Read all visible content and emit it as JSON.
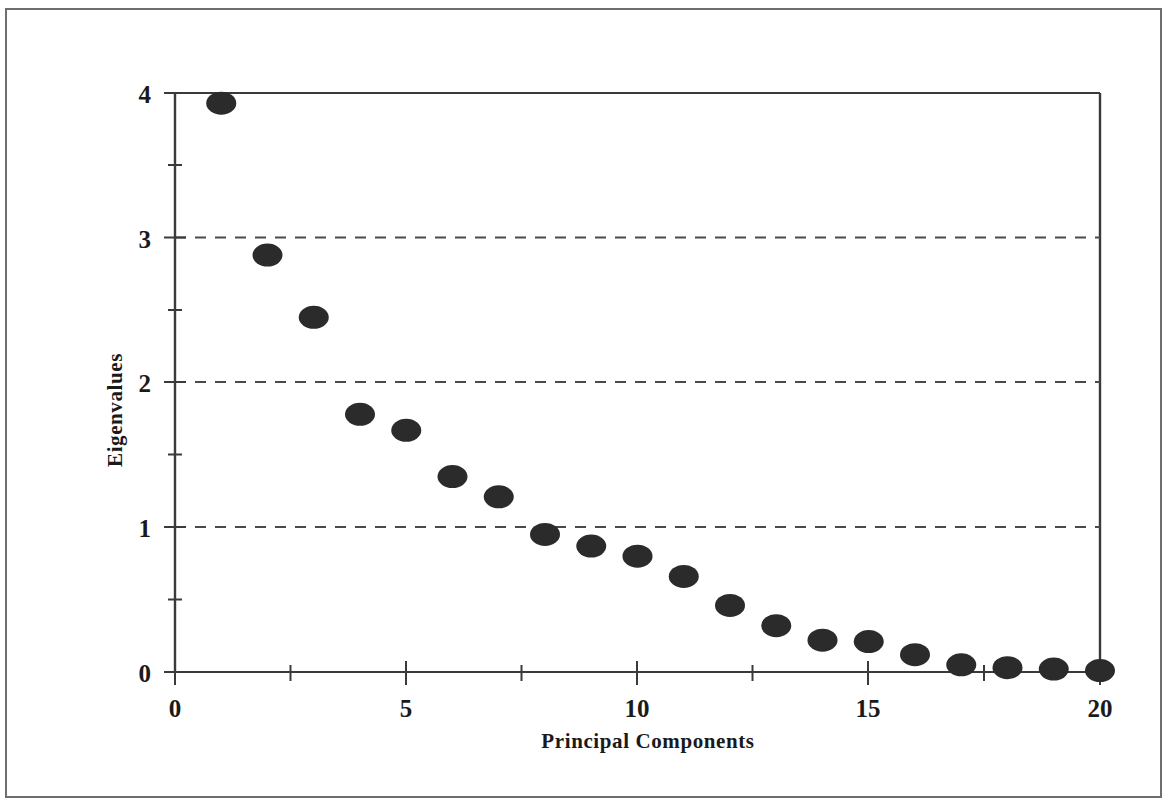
{
  "figure": {
    "kind": "scree-plot",
    "frame_color": "#6e6e6e",
    "marker_color": "#2b2b2b",
    "axis_color": "#3a3a3a",
    "gridline_color": "#4a4a4a"
  },
  "chart_data": {
    "type": "scatter",
    "title": "",
    "subtitle": "",
    "xlabel": "Principal Components",
    "ylabel": "Eigenvalues",
    "xlim": [
      0,
      20
    ],
    "ylim": [
      0,
      4
    ],
    "xticks": [
      0,
      5,
      10,
      15,
      20
    ],
    "xtick_labels": [
      "0",
      "5",
      "10",
      "15",
      "20"
    ],
    "x_minor_tick_step": 2.5,
    "yticks": [
      0,
      1,
      2,
      3,
      4
    ],
    "ytick_labels": [
      "0",
      "1",
      "2",
      "3",
      "4"
    ],
    "y_minor_tick_step": 0.5,
    "grid": true,
    "gridlines_y": [
      1,
      2,
      3
    ],
    "gridline_style": "dashed",
    "legend": null,
    "legend_position": "none",
    "marker_shape": "filled-circle",
    "x": [
      1,
      2,
      3,
      4,
      5,
      6,
      7,
      8,
      9,
      10,
      11,
      12,
      13,
      14,
      15,
      16,
      17,
      18,
      19,
      20
    ],
    "values": [
      3.93,
      2.88,
      2.45,
      1.78,
      1.67,
      1.35,
      1.21,
      0.95,
      0.87,
      0.8,
      0.66,
      0.46,
      0.32,
      0.22,
      0.21,
      0.12,
      0.05,
      0.03,
      0.02,
      0.01
    ],
    "series": [
      {
        "name": "Eigenvalues",
        "values": [
          3.93,
          2.88,
          2.45,
          1.78,
          1.67,
          1.35,
          1.21,
          0.95,
          0.87,
          0.8,
          0.66,
          0.46,
          0.32,
          0.22,
          0.21,
          0.12,
          0.05,
          0.03,
          0.02,
          0.01
        ]
      }
    ],
    "annotations": []
  }
}
